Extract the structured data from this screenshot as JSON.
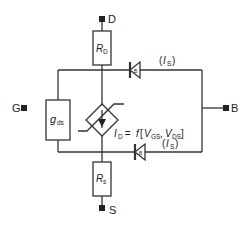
{
  "diagram": {
    "type": "MOSFET equivalent circuit",
    "terminals": {
      "drain": "D",
      "gate": "G",
      "source": "S",
      "bulk": "B"
    },
    "components": {
      "drain_resistor": {
        "symbol": "R",
        "subscript": "D"
      },
      "source_resistor": {
        "symbol": "R",
        "subscript": "s"
      },
      "output_conductance": {
        "symbol": "g",
        "subscript": "ds"
      },
      "current_source": {
        "lhs_symbol": "I",
        "lhs_subscript": "D",
        "equals": " = ",
        "func": "f",
        "open": "[",
        "arg1_symbol": "V",
        "arg1_subscript": "GS",
        "sep": ", ",
        "arg2_symbol": "V",
        "arg2_subscript": "DS",
        "close": "]"
      },
      "top_diode": {
        "inner_label": "B",
        "current_open": "(",
        "current_symbol": "I",
        "current_subscript": "S",
        "current_close": ")"
      },
      "bottom_diode": {
        "inner_label": "B",
        "current_open": "(",
        "current_symbol": "I",
        "current_subscript": "S",
        "current_close": ")"
      }
    },
    "colors": {
      "line": "#333333",
      "text": "#222222",
      "background": "#ffffff"
    }
  }
}
